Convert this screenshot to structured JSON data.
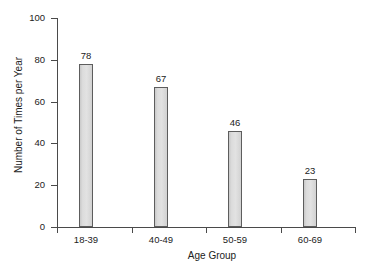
{
  "chart_data": {
    "type": "bar",
    "title": "",
    "subtitle": "",
    "xlabel": "Age Group",
    "ylabel": "Number of Times per Year",
    "categories": [
      "18-39",
      "40-49",
      "50-59",
      "60-69"
    ],
    "values": [
      78,
      67,
      46,
      23
    ],
    "value_labels": [
      "78",
      "67",
      "46",
      "23"
    ],
    "ylim": [
      0,
      100
    ],
    "yticks": [
      0,
      20,
      40,
      60,
      80,
      100
    ],
    "ytick_labels": [
      "0",
      "20",
      "40",
      "60",
      "80",
      "100"
    ],
    "grid": false,
    "legend": null,
    "legend_position": "none",
    "bar_fill_color": "#dcdcdc",
    "bar_border_color": "#5d5d5d",
    "axis_color": "#4a4a4a",
    "background_color": "#ffffff",
    "text_color": "#222222"
  }
}
